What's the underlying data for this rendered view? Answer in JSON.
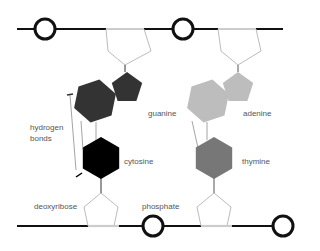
{
  "labels": {
    "guanine": "guanine",
    "adenine": "adenine",
    "cytosine": "cytosine",
    "thymine": "thymine",
    "hydrogen_bonds_line1": "hydrogen",
    "hydrogen_bonds_line2": "bonds",
    "deoxyribose": "deoxyribose",
    "phosphate": "phosphate"
  },
  "colors": {
    "guanine": "#333333",
    "adenine": "#bdbdbd",
    "cytosine": "#000000",
    "thymine": "#777777",
    "backbone": "#111111",
    "sugar_outline": "#aaaaaa",
    "bond_line": "#666666"
  },
  "pairs": [
    {
      "top_base": "guanine",
      "bottom_base": "cytosine",
      "top_type": "purine",
      "bottom_type": "pyrimidine"
    },
    {
      "top_base": "adenine",
      "bottom_base": "thymine",
      "top_type": "purine",
      "bottom_type": "pyrimidine"
    }
  ]
}
